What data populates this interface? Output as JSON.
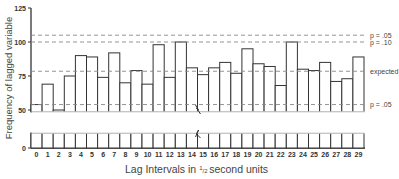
{
  "chart_data": {
    "type": "bar",
    "title": "",
    "xlabel": "Lag Intervals in 1/2 second units",
    "xlabel_parts": {
      "pre": "Lag Intervals in ",
      "frac_num": "1",
      "frac_den": "2",
      "post": "second units"
    },
    "ylabel": "Frequency of lagged variable",
    "ylim": [
      0,
      125
    ],
    "yticks": [
      0,
      50,
      75,
      100,
      125
    ],
    "axis_break": {
      "between": [
        0,
        50
      ],
      "shown": true
    },
    "grid": false,
    "categories": [
      "0",
      "1",
      "2",
      "3",
      "4",
      "5",
      "6",
      "7",
      "8",
      "9",
      "10",
      "11",
      "12",
      "13",
      "14",
      "15",
      "16",
      "17",
      "18",
      "19",
      "20",
      "21",
      "22",
      "23",
      "24",
      "25",
      "26",
      "27",
      "28",
      "29"
    ],
    "values": [
      54,
      69,
      50,
      75,
      90,
      89,
      74,
      92,
      70,
      79,
      69,
      98,
      74,
      100,
      81,
      76,
      81,
      85,
      77,
      95,
      84,
      82,
      68,
      100,
      80,
      79,
      85,
      71,
      73,
      89
    ],
    "reference_lines": [
      {
        "label": "p = .05",
        "value": 105,
        "style": "dashed"
      },
      {
        "label": "p = .10",
        "value": 100,
        "style": "dashed"
      },
      {
        "label": "expected",
        "value": 78.5,
        "style": "dashed"
      },
      {
        "label": "p = .05",
        "value": 54,
        "style": "dashed"
      }
    ],
    "colors": {
      "bar_fill": "#ffffff",
      "bar_stroke": "#333333",
      "ref_line": "#888888",
      "axis": "#333333"
    }
  }
}
